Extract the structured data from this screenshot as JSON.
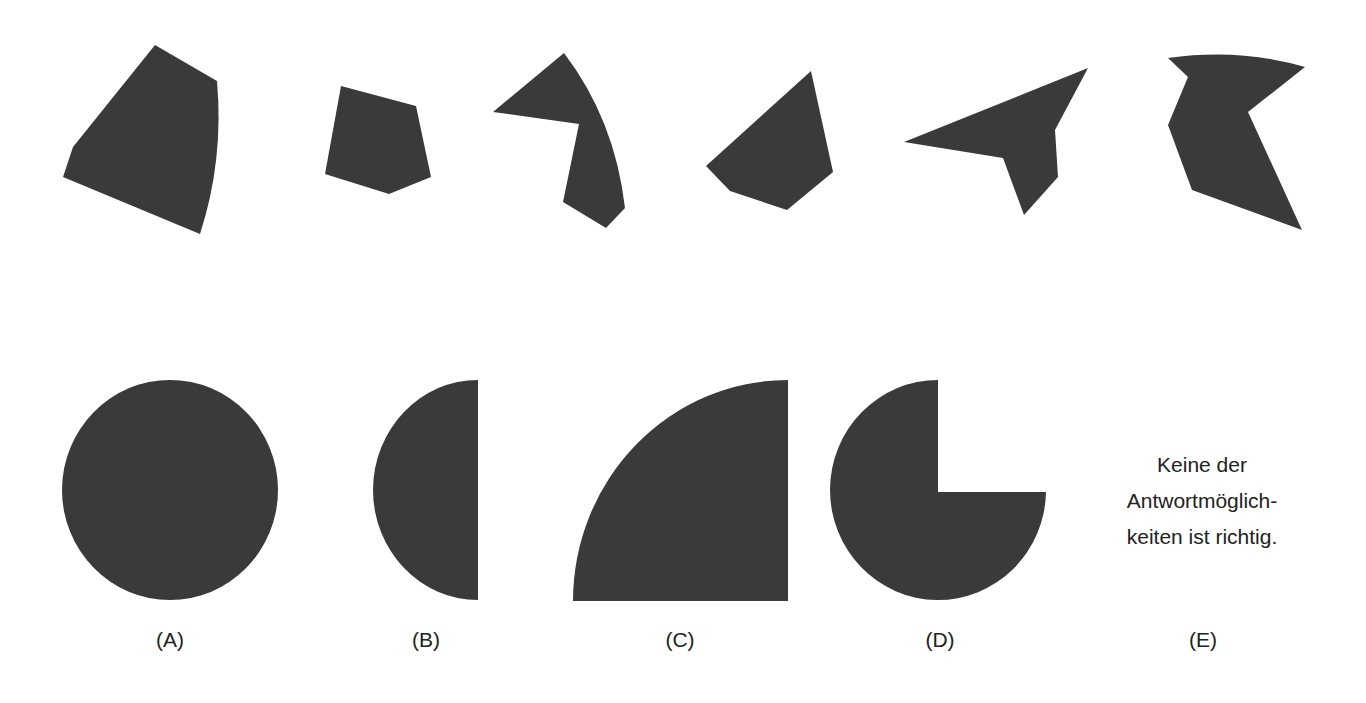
{
  "colors": {
    "shape_fill": "#3a3a3a",
    "background": "#ffffff",
    "text": "#222222"
  },
  "sequence": {
    "description": "Row of six dark polygon figures (pieces to be assembled)",
    "pieces": [
      {
        "id": "piece-1",
        "path": "M155,45 L217,81 Q224,160 200,234 L63,177 L73,147 Z"
      },
      {
        "id": "piece-2",
        "path": "M341,86 L416,106 L431,177 L389,194 L325,174 Z"
      },
      {
        "id": "piece-3",
        "path": "M564,53 Q615,120 625,208 L606,228 L563,202 L579,124 L493,112 Z"
      },
      {
        "id": "piece-4",
        "path": "M811,71 L833,172 L787,210 L730,191 L706,166 Z"
      },
      {
        "id": "piece-5",
        "path": "M904,142 L1088,68 L1055,130 L1058,177 L1024,215 L1003,158 Z"
      },
      {
        "id": "piece-6",
        "path": "M1168,58 Q1240,48 1305,67 L1248,112 L1302,230 L1192,190 L1168,125 L1188,77 Z"
      }
    ]
  },
  "answers": [
    {
      "key": "A",
      "label": "(A)",
      "label_x": 170,
      "shape": "circle"
    },
    {
      "key": "B",
      "label": "(B)",
      "label_x": 426,
      "shape": "half-circle"
    },
    {
      "key": "C",
      "label": "(C)",
      "label_x": 680,
      "shape": "quarter-circle"
    },
    {
      "key": "D",
      "label": "(D)",
      "label_x": 940,
      "shape": "three-quarter-circle"
    },
    {
      "key": "E",
      "label": "(E)",
      "label_x": 1203,
      "shape": "text"
    }
  ],
  "option_e": {
    "line1": "Keine der",
    "line2": "Antwortmöglich-",
    "line3": "keiten ist richtig."
  },
  "answer_shapes": {
    "a": "M62,490 A108,110 0 1,0 278,490 A108,110 0 1,0 62,490 Z",
    "b": "M478,380 A105,110 0 0,0 478,600 Z",
    "c": "M573,601 A215,221 0 0,1 788,380 L788,601 Z",
    "d": "M938,380 L938,492 L1046,492 A108,110 0 1,1 938,380 Z"
  }
}
